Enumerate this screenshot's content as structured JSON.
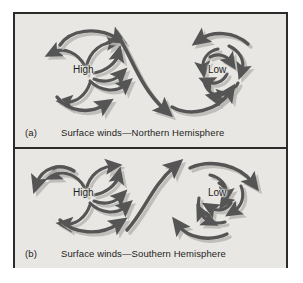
{
  "figure": {
    "border_color": "#2b2b2b",
    "background_color": "#e9e7e3",
    "page_color": "#ffffff",
    "arrow_color": "#555555",
    "arrow_shadow_color": "#b4b2ae"
  },
  "panels": [
    {
      "id": "a",
      "tag": "(a)",
      "caption": "Surface winds—Northern Hemisphere",
      "systems": [
        {
          "type": "high",
          "label": "High",
          "rotation": "clockwise",
          "flow": "outward",
          "description": "anticyclone diverging clockwise"
        },
        {
          "type": "low",
          "label": "Low",
          "rotation": "counterclockwise",
          "flow": "inward",
          "description": "cyclone converging counterclockwise"
        }
      ],
      "connector": {
        "name": "high-to-low-flow-arrow",
        "from": "High",
        "to": "Low"
      }
    },
    {
      "id": "b",
      "tag": "(b)",
      "caption": "Surface winds—Southern Hemisphere",
      "systems": [
        {
          "type": "high",
          "label": "High",
          "rotation": "counterclockwise",
          "flow": "outward",
          "description": "anticyclone diverging counterclockwise"
        },
        {
          "type": "low",
          "label": "Low",
          "rotation": "clockwise",
          "flow": "inward",
          "description": "cyclone converging clockwise"
        }
      ],
      "connector": {
        "name": "high-to-low-flow-arrow",
        "from": "High",
        "to": "Low"
      }
    }
  ]
}
